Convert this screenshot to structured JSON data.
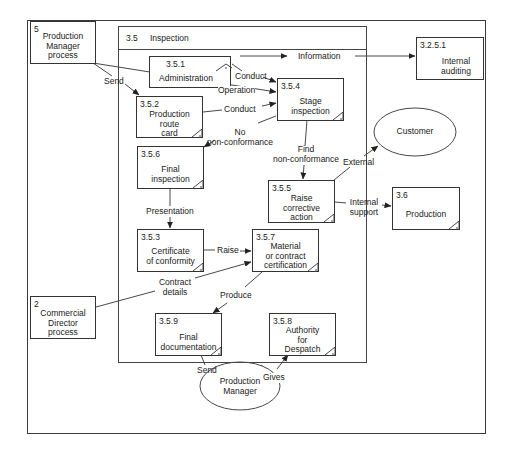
{
  "diagram": {
    "colors": {
      "line": "#333333",
      "frame": "#3a3a3a",
      "background": "#ffffff"
    },
    "container": {
      "number": "3.5",
      "title": "Inspection"
    },
    "external_processes": [
      {
        "id": "5",
        "number": "5",
        "label": "Production\nManager\nprocess"
      },
      {
        "id": "2",
        "number": "2",
        "label": "Commercial\nDirector\nprocess"
      },
      {
        "id": "3.2.5.1",
        "number": "3.2.5.1",
        "label": "Internal\nauditing"
      },
      {
        "id": "3.6",
        "number": "3.6",
        "label": "Production"
      }
    ],
    "processes": [
      {
        "id": "3.5.1",
        "number": "3.5.1",
        "label": "Administration"
      },
      {
        "id": "3.5.2",
        "number": "3.5.2",
        "label": "Production\nroute\ncard"
      },
      {
        "id": "3.5.4",
        "number": "3.5.4",
        "label": "Stage\ninspection"
      },
      {
        "id": "3.5.6",
        "number": "3.5.6",
        "label": "Final\ninspection"
      },
      {
        "id": "3.5.5",
        "number": "3.5.5",
        "label": "Raise\ncorrective\naction"
      },
      {
        "id": "3.5.3",
        "number": "3.5.3",
        "label": "Certificate\nof conformity"
      },
      {
        "id": "3.5.7",
        "number": "3.5.7",
        "label": "Material\nor contract\ncertification"
      },
      {
        "id": "3.5.9",
        "number": "3.5.9",
        "label": "Final\ndocumentation"
      },
      {
        "id": "3.5.8",
        "number": "3.5.8",
        "label": "Authority\nfor\nDespatch"
      }
    ],
    "externals": [
      {
        "id": "customer",
        "label": "Customer"
      },
      {
        "id": "production-manager",
        "label": "Production\nManager"
      }
    ],
    "flows": [
      {
        "from": "5",
        "to": "3.5.2",
        "label": "Send"
      },
      {
        "from": "5",
        "to": "3.5.4",
        "label": "Operation"
      },
      {
        "from": "3.5.1",
        "to": "3.5.4",
        "label": "Conduct"
      },
      {
        "from": "3.5.1",
        "to": "3.2.5.1",
        "label": "Information"
      },
      {
        "from": "3.5.2",
        "to": "3.5.4",
        "label": "Conduct"
      },
      {
        "from": "3.5.4",
        "to": "3.5.6",
        "label": "No\nnon-conformance"
      },
      {
        "from": "3.5.4",
        "to": "3.5.5",
        "label": "Find\nnon-conformance"
      },
      {
        "from": "3.5.5",
        "to": "customer",
        "label": "External"
      },
      {
        "from": "3.5.5",
        "to": "3.6",
        "label": "Internal\nsupport"
      },
      {
        "from": "3.5.6",
        "to": "3.5.3",
        "label": "Presentation"
      },
      {
        "from": "3.5.3",
        "to": "3.5.7",
        "label": "Raise"
      },
      {
        "from": "2",
        "to": "3.5.7",
        "label": "Contract\ndetails"
      },
      {
        "from": "3.5.7",
        "to": "3.5.9",
        "label": "Produce"
      },
      {
        "from": "3.5.9",
        "to": "production-manager",
        "label": "Send"
      },
      {
        "from": "production-manager",
        "to": "3.5.8",
        "label": "Gives"
      }
    ]
  }
}
